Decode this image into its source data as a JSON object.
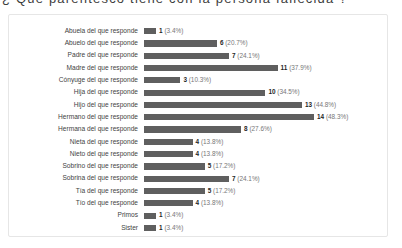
{
  "title_strip": {
    "text": "¿ Qué parentesco tiene con la persona fallecida ?"
  },
  "chart_data": {
    "type": "bar",
    "orientation": "horizontal",
    "title": "",
    "xlabel": "",
    "ylabel": "",
    "grid": false,
    "legend": false,
    "max_value": 14,
    "bar_color": "#5f5f5f",
    "categories": [
      "Abuela del que responde",
      "Abuelo del que responde",
      "Padre del que responde",
      "Madre del que responde",
      "Cónyuge del que responde",
      "Hija del que responde",
      "Hijo del que responde",
      "Hermano del que responde",
      "Hermana del que responde",
      "Nieta del que responde",
      "Nieto del que responde",
      "Sobrino del que responde",
      "Sobrina del que responde",
      "Tía del que responde",
      "Tío del que responde",
      "Primos",
      "Sister"
    ],
    "values": [
      1,
      6,
      7,
      11,
      3,
      10,
      13,
      14,
      8,
      4,
      4,
      5,
      7,
      5,
      4,
      1,
      1
    ],
    "percent_labels": [
      "(3.4%)",
      "(20.7%)",
      "(24.1%)",
      "(37.9%)",
      "(10.3%)",
      "(34.5%)",
      "(44.8%)",
      "(48.3%)",
      "(27.6%)",
      "(13.8%)",
      "(13.8%)",
      "(17.2%)",
      "(24.1%)",
      "(17.2%)",
      "(13.8%)",
      "(3.4%)",
      "(3.4%)"
    ],
    "percents": [
      3.4,
      20.7,
      24.1,
      37.9,
      10.3,
      34.5,
      44.8,
      48.3,
      27.6,
      13.8,
      13.8,
      17.2,
      24.1,
      17.2,
      13.8,
      3.4,
      3.4
    ]
  }
}
